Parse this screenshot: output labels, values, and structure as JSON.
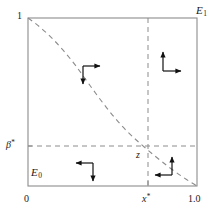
{
  "figure": {
    "kind": "phase-plane-diagram",
    "background_color": "#ffffff",
    "ink_color": "#595959",
    "text_color": "#1a1a1a",
    "arrow_color": "#111111"
  },
  "axes": {
    "box": {
      "left": 28,
      "top": 18,
      "right": 197,
      "bottom": 186
    },
    "x_axis": {
      "label": "",
      "range": [
        0,
        1.0
      ],
      "ticks": [
        {
          "id": "x-tick-0",
          "value": 0,
          "label": "0",
          "italic": false,
          "star": false,
          "px": 28
        },
        {
          "id": "x-tick-star",
          "value": 0.71,
          "label": "x",
          "italic": true,
          "star": true,
          "px": 148
        },
        {
          "id": "x-tick-1",
          "value": 1.0,
          "label": "1.0",
          "italic": false,
          "star": false,
          "px": 197
        }
      ]
    },
    "y_axis": {
      "label": "",
      "range": [
        0,
        1.0
      ],
      "ticks": [
        {
          "id": "y-tick-beta",
          "value": 0.24,
          "label": "β",
          "italic": true,
          "star": true,
          "px": 146
        },
        {
          "id": "y-tick-1",
          "value": 1.0,
          "label": "1",
          "italic": false,
          "star": false,
          "px": 18
        }
      ]
    }
  },
  "corner_labels": {
    "top_right": {
      "base": "E",
      "subscript": "1"
    },
    "bottom_left": {
      "base": "E",
      "subscript": "0"
    }
  },
  "equilibrium": {
    "label": "z",
    "x_value": 0.71,
    "y_value": 0.24,
    "px": {
      "x": 148,
      "y": 146
    }
  },
  "curve": {
    "name": "nullcline",
    "style": "dashed",
    "points": [
      [
        0.0,
        1.0
      ],
      [
        0.12,
        0.93
      ],
      [
        0.26,
        0.82
      ],
      [
        0.4,
        0.68
      ],
      [
        0.53,
        0.5
      ],
      [
        0.64,
        0.34
      ],
      [
        0.71,
        0.24
      ],
      [
        0.8,
        0.15
      ],
      [
        0.9,
        0.07
      ],
      [
        1.0,
        0.0
      ]
    ]
  },
  "guide_lines": [
    {
      "name": "vertical-dashed-xstar",
      "orientation": "vertical",
      "at": 0.71,
      "style": "dashed"
    },
    {
      "name": "horizontal-dashed-beta",
      "orientation": "horizontal",
      "at": 0.24,
      "style": "dashed"
    }
  ],
  "vector_field_arrows": [
    {
      "id": "arrow-cluster-top-right",
      "quadrant": "top-right",
      "directions": [
        "up",
        "right"
      ],
      "px": {
        "x": 168,
        "y": 62
      }
    },
    {
      "id": "arrow-cluster-upper-curve",
      "quadrant": "upper-left-curve",
      "directions": [
        "right",
        "down"
      ],
      "px": {
        "x": 86,
        "y": 70
      }
    },
    {
      "id": "arrow-cluster-bottom-left",
      "quadrant": "bottom-left",
      "directions": [
        "left",
        "down"
      ],
      "px": {
        "x": 86,
        "y": 168
      }
    },
    {
      "id": "arrow-cluster-lower-curve",
      "quadrant": "bottom-right-curve",
      "directions": [
        "up",
        "left"
      ],
      "px": {
        "x": 176,
        "y": 170
      }
    }
  ]
}
